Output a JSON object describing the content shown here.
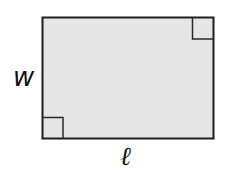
{
  "diagram": {
    "shape": "rectangle",
    "fill_color": "#e6e6e6",
    "stroke_color": "#1e1e1e",
    "labels": {
      "width": "w",
      "length": "ℓ"
    },
    "right_angle_markers": [
      "top-right",
      "bottom-left"
    ]
  }
}
